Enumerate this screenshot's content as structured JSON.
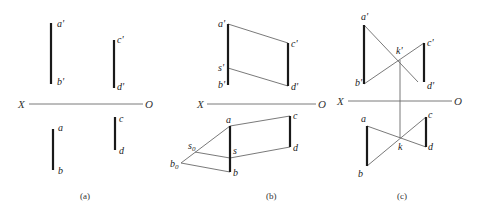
{
  "figure": {
    "captions": [
      "(a)",
      "(b)",
      "(c)"
    ],
    "axis_labels": {
      "left": "X",
      "right": "O"
    }
  },
  "panel_a": {
    "labels": {
      "a1": "a'",
      "b1": "b'",
      "c1": "c'",
      "d1": "d'",
      "a": "a",
      "b": "b",
      "c": "c",
      "d": "d"
    }
  },
  "panel_b": {
    "labels": {
      "a1": "a'",
      "s1": "s'",
      "b1": "b'",
      "c1": "c'",
      "d1": "d'",
      "a": "a",
      "s": "s",
      "b": "b",
      "c": "c",
      "d": "d",
      "s0": "s",
      "s0_sub": "0",
      "b0": "b",
      "b0_sub": "0"
    }
  },
  "panel_c": {
    "labels": {
      "a1": "a'",
      "b1": "b'",
      "k1": "k'",
      "c1": "c'",
      "d1": "d'",
      "a": "a",
      "b": "b",
      "k": "k",
      "c": "c",
      "d": "d"
    }
  }
}
